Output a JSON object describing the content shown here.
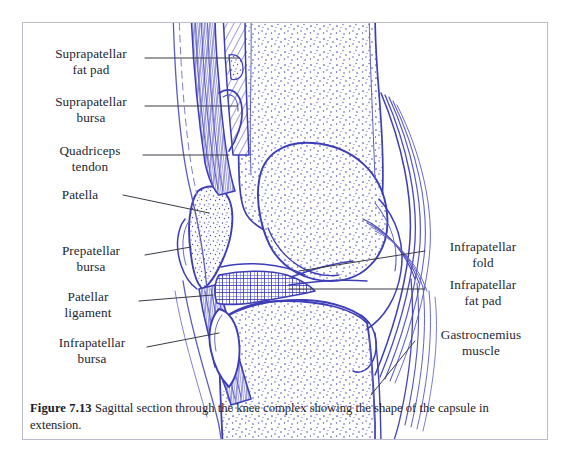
{
  "figure": {
    "number_label": "Figure 7.13",
    "caption_text": "Sagittal section through the knee complex showing the shape of the capsule in extension.",
    "frame_border_color": "#bcbcd0",
    "background_color": "#ffffff",
    "ink_color": "#3d3db8",
    "stipple_color": "#4a4ab5",
    "leader_color": "#3a3a44",
    "text_color": "#231f30"
  },
  "illustration": {
    "name": "sagittal-section-knee-complex",
    "description": "Line drawing, sagittal section of the knee showing femur, patella, tibia, joint capsule, bursae, fat pads and tendons"
  },
  "labels": {
    "left": [
      {
        "id": "suprapatellar-fat-pad",
        "line1": "Suprapatellar",
        "line2": "fat pad"
      },
      {
        "id": "suprapatellar-bursa",
        "line1": "Suprapatellar",
        "line2": "bursa"
      },
      {
        "id": "quadriceps-tendon",
        "line1": "Quadriceps",
        "line2": "tendon"
      },
      {
        "id": "patella",
        "line1": "Patella",
        "line2": ""
      },
      {
        "id": "prepatellar-bursa",
        "line1": "Prepatellar",
        "line2": "bursa"
      },
      {
        "id": "patellar-ligament",
        "line1": "Patellar",
        "line2": "ligament"
      },
      {
        "id": "infrapatellar-bursa",
        "line1": "Infrapatellar",
        "line2": "bursa"
      }
    ],
    "right": [
      {
        "id": "infrapatellar-fold",
        "line1": "Infrapatellar",
        "line2": "fold"
      },
      {
        "id": "infrapatellar-fat-pad",
        "line1": "Infrapatellar",
        "line2": "fat pad"
      },
      {
        "id": "gastrocnemius-muscle",
        "line1": "Gastrocnemius",
        "line2": "muscle"
      }
    ]
  }
}
